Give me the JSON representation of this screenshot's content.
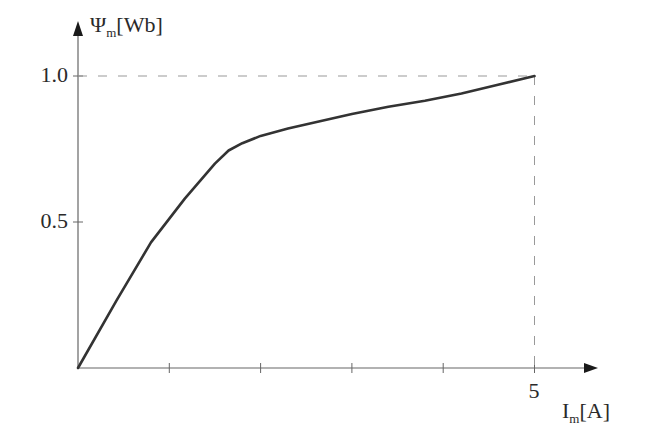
{
  "chart_data": {
    "type": "line",
    "title": "",
    "xlabel": "I_m[A]",
    "ylabel": "Ψ_m[Wb]",
    "xlabel_parts": {
      "main": "I",
      "sub": "m",
      "unit": "[A]"
    },
    "ylabel_parts": {
      "main": "Ψ",
      "sub": "m",
      "unit": "[Wb]"
    },
    "x_ticks": [
      1,
      2,
      3,
      4,
      5
    ],
    "x_tick_labels": [
      "",
      "",
      "",
      "",
      "5"
    ],
    "y_ticks": [
      0.5,
      1.0
    ],
    "y_tick_labels": [
      "0.5",
      "1.0"
    ],
    "xlim": [
      0,
      5.6
    ],
    "ylim": [
      0,
      1.18
    ],
    "grid": false,
    "legend": null,
    "reference_lines": [
      {
        "type": "horizontal-dashed",
        "y": 1.0,
        "x_from": 0,
        "x_to": 5
      },
      {
        "type": "vertical-dashed",
        "x": 5,
        "y_from": 0,
        "y_to": 1.0
      }
    ],
    "series": [
      {
        "name": "magnetization curve",
        "x": [
          0,
          0.42,
          0.8,
          1.17,
          1.5,
          1.65,
          1.8,
          2.0,
          2.3,
          2.65,
          3.0,
          3.4,
          3.8,
          4.2,
          4.6,
          5.0
        ],
        "y": [
          0,
          0.23,
          0.43,
          0.58,
          0.7,
          0.745,
          0.77,
          0.795,
          0.82,
          0.845,
          0.87,
          0.895,
          0.915,
          0.94,
          0.97,
          1.0
        ]
      }
    ]
  }
}
